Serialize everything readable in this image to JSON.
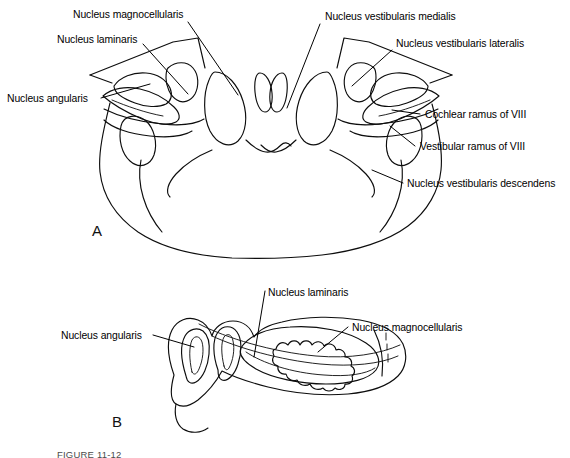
{
  "figure": {
    "caption": "FIGURE 11-12",
    "panels": [
      {
        "id": "A",
        "letter": "A",
        "view": "transverse-section"
      },
      {
        "id": "B",
        "letter": "B",
        "view": "parasagittal-section"
      }
    ]
  },
  "panel_a": {
    "letter": "A",
    "labels": [
      {
        "name": "nucleus-magnocellularis",
        "text": "Nucleus magnocellularis",
        "x": 73,
        "y": 9,
        "side": "left"
      },
      {
        "name": "nucleus-laminaris",
        "text": "Nucleus laminaris",
        "x": 57,
        "y": 34,
        "side": "left"
      },
      {
        "name": "nucleus-angularis",
        "text": "Nucleus angularis",
        "x": 7,
        "y": 93,
        "side": "left"
      },
      {
        "name": "nucleus-vestibularis-medialis",
        "text": "Nucleus vestibularis medialis",
        "x": 325,
        "y": 11,
        "side": "right"
      },
      {
        "name": "nucleus-vestibularis-lateralis",
        "text": "Nucleus vestibularis lateralis",
        "x": 396,
        "y": 38,
        "side": "right"
      },
      {
        "name": "cochlear-ramus-of-viii",
        "text": "Cochlear ramus of VIII",
        "x": 425,
        "y": 109,
        "side": "right"
      },
      {
        "name": "vestibular-ramus-of-viii",
        "text": "Vestibular ramus of VIII",
        "x": 420,
        "y": 141,
        "side": "right"
      },
      {
        "name": "nucleus-vestibularis-descendens",
        "text": "Nucleus vestibularis descendens",
        "x": 407,
        "y": 178,
        "side": "right"
      }
    ],
    "letter_pos": {
      "x": 92,
      "y": 222
    }
  },
  "panel_b": {
    "letter": "B",
    "labels": [
      {
        "name": "nucleus-laminaris",
        "text": "Nucleus laminaris",
        "x": 268,
        "y": 287,
        "side": "top"
      },
      {
        "name": "nucleus-magnocellularis",
        "text": "Nucleus magnocellularis",
        "x": 352,
        "y": 322,
        "side": "right"
      },
      {
        "name": "nucleus-angularis",
        "text": "Nucleus angularis",
        "x": 61,
        "y": 330,
        "side": "left"
      }
    ],
    "letter_pos": {
      "x": 112,
      "y": 413
    }
  },
  "style": {
    "ink": "#0d0d0d",
    "background": "#ffffff",
    "caption_color": "#4a4a4a"
  }
}
